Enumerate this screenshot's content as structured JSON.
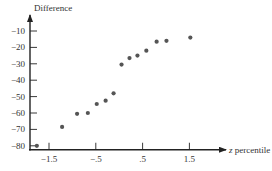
{
  "chart_data": {
    "type": "scatter",
    "title": "",
    "xlabel_italic": "z",
    "xlabel_rest": " percentile",
    "ylabel": "Difference",
    "xlim": [
      -1.9,
      2.3
    ],
    "ylim": [
      -82.4,
      -3
    ],
    "x_ticks": [
      -1.5,
      -0.5,
      0.5,
      1.5
    ],
    "x_tick_labels": [
      "−1.5",
      "−.5",
      ".5",
      "1.5"
    ],
    "y_ticks": [
      -10,
      -20,
      -30,
      -40,
      -50,
      -60,
      -70,
      -80
    ],
    "y_tick_labels": [
      "−10",
      "−20",
      "−30",
      "−40",
      "−50",
      "−60",
      "−70",
      "−80"
    ],
    "grid": false,
    "legend": "none",
    "points": [
      {
        "x": -1.76,
        "y": -80
      },
      {
        "x": -1.22,
        "y": -68.5
      },
      {
        "x": -0.9,
        "y": -60.5
      },
      {
        "x": -0.67,
        "y": -60
      },
      {
        "x": -0.48,
        "y": -54.5
      },
      {
        "x": -0.29,
        "y": -52.5
      },
      {
        "x": -0.12,
        "y": -48
      },
      {
        "x": 0.05,
        "y": -30.5
      },
      {
        "x": 0.22,
        "y": -26.5
      },
      {
        "x": 0.39,
        "y": -25
      },
      {
        "x": 0.58,
        "y": -22
      },
      {
        "x": 0.8,
        "y": -16.5
      },
      {
        "x": 1.01,
        "y": -16
      },
      {
        "x": 1.52,
        "y": -14
      }
    ]
  }
}
